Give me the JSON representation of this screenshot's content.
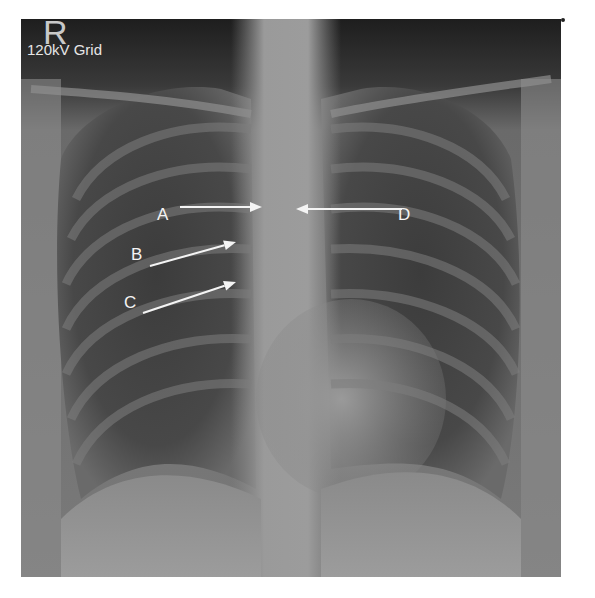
{
  "image": {
    "type": "chest-radiograph",
    "view": "PA chest X-ray"
  },
  "markers": {
    "side": "R",
    "technique": "120kV Grid"
  },
  "annotations": [
    {
      "label": "A",
      "text_x": 163,
      "text_y": 215,
      "arrow": {
        "x1": 180,
        "y1": 207,
        "x2": 262,
        "y2": 207
      }
    },
    {
      "label": "B",
      "text_x": 137,
      "text_y": 255,
      "arrow": {
        "x1": 150,
        "y1": 266,
        "x2": 236,
        "y2": 242
      }
    },
    {
      "label": "C",
      "text_x": 130,
      "text_y": 303,
      "arrow": {
        "x1": 143,
        "y1": 313,
        "x2": 236,
        "y2": 282
      }
    },
    {
      "label": "D",
      "text_x": 404,
      "text_y": 215,
      "arrow": {
        "x1": 402,
        "y1": 209,
        "x2": 296,
        "y2": 209
      }
    }
  ],
  "colors": {
    "annotation": "#f4f4f4",
    "background": "#ffffff"
  }
}
